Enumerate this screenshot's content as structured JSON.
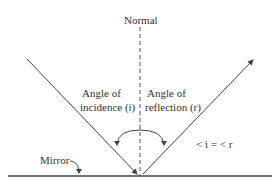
{
  "diagram": {
    "labels": {
      "normal": "Normal",
      "incidence_line1": "Angle of",
      "incidence_line2": "incidence (i)",
      "reflection_line1": "Angle of",
      "reflection_line2": "reflection (r)",
      "equation": "< i = < r",
      "mirror": "Mirror"
    },
    "colors": {
      "line": "#444444",
      "text": "#333333",
      "background": "#ffffff"
    }
  }
}
